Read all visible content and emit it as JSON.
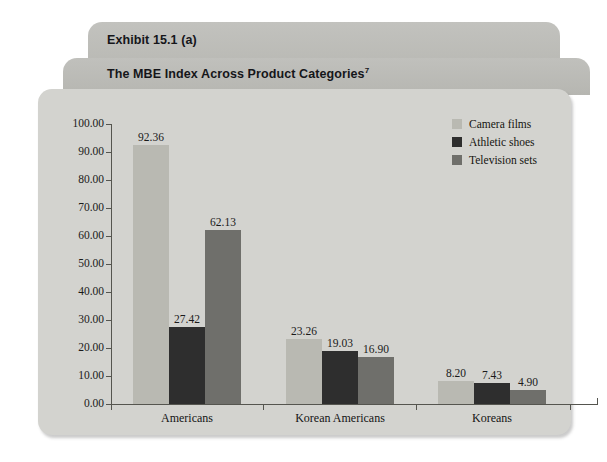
{
  "exhibit": {
    "tab_label": "Exhibit 15.1 (a)",
    "subtitle": "The MBE Index Across Product Categories",
    "footnote_marker": "7"
  },
  "colors": {
    "card_background": "#d3d3cf",
    "tab_background": "#bcbcb8",
    "page_background": "#ffffff",
    "axis": "#55554f",
    "camera_films": "#b9b9b2",
    "athletic_shoes": "#2e2e2e",
    "television_sets": "#6f6f6b"
  },
  "chart_data": {
    "type": "bar",
    "title": "The MBE Index Across Product Categories",
    "xlabel": "",
    "ylabel": "",
    "ylim": [
      0,
      100
    ],
    "yticks": [
      "0.00",
      "10.00",
      "20.00",
      "30.00",
      "40.00",
      "50.00",
      "60.00",
      "70.00",
      "80.00",
      "90.00",
      "100.00"
    ],
    "grid": false,
    "legend_position": "top-right",
    "categories": [
      "Americans",
      "Korean Americans",
      "Koreans"
    ],
    "series": [
      {
        "name": "Camera films",
        "color": "#b9b9b2",
        "values": [
          92.36,
          23.26,
          8.2
        ],
        "labels": [
          "92.36",
          "23.26",
          "8.20"
        ]
      },
      {
        "name": "Athletic shoes",
        "color": "#2e2e2e",
        "values": [
          27.42,
          19.03,
          7.43
        ],
        "labels": [
          "27.42",
          "19.03",
          "7.43"
        ]
      },
      {
        "name": "Television sets",
        "color": "#6f6f6b",
        "values": [
          62.13,
          16.9,
          4.9
        ],
        "labels": [
          "62.13",
          "16.90",
          "4.90"
        ]
      }
    ]
  }
}
